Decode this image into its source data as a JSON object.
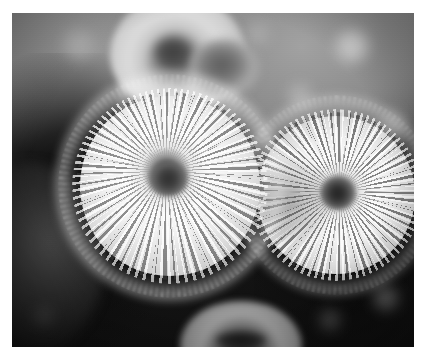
{
  "image": {
    "title": "Macro photograph of pincushion cacti",
    "subject": "cactus-cluster",
    "color_mode": "grayscale",
    "width_px": 425,
    "height_px": 358,
    "border": {
      "color": "#ffffff",
      "left_px": 12,
      "top_px": 13,
      "right_px": 11,
      "bottom_px": 11
    },
    "photo": {
      "width_px": 402,
      "height_px": 334,
      "background_description": "blurred bokeh foliage, light gray at top fading to near-black at bottom",
      "colors": {
        "highlight": "#fbfbfb",
        "midtone": "#8f8f8f",
        "shadow": "#101010",
        "core_dark": "#2e2e2e"
      }
    },
    "subjects": [
      {
        "name": "cactus-left",
        "label": "Large left pincushion cactus",
        "center_x": 158,
        "center_y": 173,
        "radius_px": 98,
        "focus": "sharp",
        "description": "radial white spine rosette with dark sunken apex"
      },
      {
        "name": "cactus-right",
        "label": "Large right pincushion cactus",
        "center_x": 324,
        "center_y": 182,
        "radius_px": 86,
        "focus": "sharp",
        "description": "radial white spine rosette with dark apex and shaded left flank"
      },
      {
        "name": "cactus-top",
        "label": "Upper background cactus",
        "center_x": 166,
        "center_y": 41,
        "radius_px": 68,
        "focus": "blurred",
        "description": "out-of-focus crown with dark center"
      },
      {
        "name": "cactus-top-right",
        "label": "Small upper-right cactus bud",
        "center_x": 213,
        "center_y": 55,
        "radius_px": 35,
        "focus": "blurred",
        "description": "small dark rounded bud"
      },
      {
        "name": "cactus-bottom",
        "label": "Lower edge cactus",
        "center_x": 229,
        "center_y": 332,
        "radius_px": 61,
        "focus": "blurred",
        "description": "partially visible crown cropped by the bottom edge"
      },
      {
        "name": "cactus-left-mid",
        "label": "Left mid-ground cactus in shadow",
        "center_x": 19,
        "center_y": 245,
        "radius_px": 75,
        "focus": "blurred",
        "description": "dimly lit rounded form at the left edge"
      }
    ],
    "bokeh_highlights": [
      {
        "x": 352,
        "y": 46,
        "size": 34,
        "tone": "#d8d8d8"
      },
      {
        "x": 300,
        "y": 96,
        "size": 26,
        "tone": "#b8b8b8"
      },
      {
        "x": 78,
        "y": 44,
        "size": 30,
        "tone": "#b2b2b2"
      },
      {
        "x": 392,
        "y": 124,
        "size": 28,
        "tone": "#a6a6a6"
      },
      {
        "x": 258,
        "y": 34,
        "size": 24,
        "tone": "#aeaeae"
      },
      {
        "x": 386,
        "y": 298,
        "size": 26,
        "tone": "#6a6a6a"
      },
      {
        "x": 330,
        "y": 320,
        "size": 22,
        "tone": "#4e4e4e"
      },
      {
        "x": 44,
        "y": 316,
        "size": 20,
        "tone": "#3a3a3a"
      },
      {
        "x": 138,
        "y": 20,
        "size": 22,
        "tone": "#9e9e9e"
      }
    ]
  }
}
